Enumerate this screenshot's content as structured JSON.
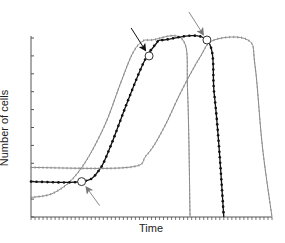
{
  "chart_data": {
    "type": "line",
    "title": "",
    "xlabel": "Time",
    "ylabel": "Number of cells",
    "x_ticks_labeled": false,
    "y_ticks_labeled": false,
    "grid": false,
    "legend": null,
    "xlim": [
      0,
      100
    ],
    "ylim": [
      0,
      100
    ],
    "series": [
      {
        "name": "curve-left",
        "color": "#8a8a8a",
        "marker": "small-tick",
        "points": [
          [
            0,
            11
          ],
          [
            10,
            14
          ],
          [
            20,
            26
          ],
          [
            30,
            50
          ],
          [
            37,
            75
          ],
          [
            42,
            92
          ],
          [
            46,
            99
          ],
          [
            50,
            100
          ],
          [
            63,
            100
          ],
          [
            65,
            70
          ],
          [
            66,
            0
          ]
        ]
      },
      {
        "name": "curve-middle",
        "color": "#111111",
        "marker": "dot",
        "points": [
          [
            0,
            20
          ],
          [
            21,
            20
          ],
          [
            28,
            26
          ],
          [
            33,
            40
          ],
          [
            40,
            65
          ],
          [
            47,
            88
          ],
          [
            52,
            98
          ],
          [
            55,
            100
          ],
          [
            73,
            100
          ],
          [
            76,
            70
          ],
          [
            78,
            40
          ],
          [
            80,
            0
          ]
        ]
      },
      {
        "name": "curve-right",
        "color": "#8a8a8a",
        "marker": "small-tick",
        "points": [
          [
            0,
            28
          ],
          [
            40,
            28
          ],
          [
            48,
            35
          ],
          [
            55,
            50
          ],
          [
            62,
            70
          ],
          [
            70,
            90
          ],
          [
            76,
            100
          ],
          [
            90,
            100
          ],
          [
            93,
            85
          ],
          [
            96,
            40
          ],
          [
            100,
            0
          ]
        ]
      }
    ],
    "annotations": [
      {
        "type": "open-circle",
        "x": 21,
        "y": 20,
        "arrow_color": "#8a8a8a",
        "arrow_from": "lower-right"
      },
      {
        "type": "open-circle",
        "x": 49,
        "y": 91,
        "arrow_color": "#111111",
        "arrow_from": "upper-left"
      },
      {
        "type": "open-circle",
        "x": 73,
        "y": 100,
        "arrow_color": "#8a8a8a",
        "arrow_from": "upper-left"
      }
    ],
    "y_tick_count": 10,
    "x_tick_count": 60
  },
  "colors": {
    "axis": "#555555",
    "black_curve": "#111111",
    "gray_curve": "#8a8a8a"
  }
}
